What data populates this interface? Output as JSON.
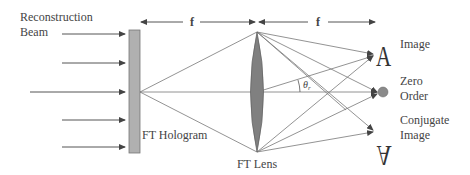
{
  "diagram": {
    "type": "optical-setup",
    "labels": {
      "reconstruction_beam_line1": "Reconstruction",
      "reconstruction_beam_line2": "Beam",
      "focal_length_1": "f",
      "focal_length_2": "f",
      "hologram": "FT Hologram",
      "lens": "FT Lens",
      "image": "Image",
      "zero_order_line1": "Zero",
      "zero_order_line2": "Order",
      "conjugate_line1": "Conjugate",
      "conjugate_line2": "Image",
      "angle_symbol": "θ",
      "angle_subscript": "r",
      "image_glyph": "A",
      "conjugate_glyph": "A"
    },
    "colors": {
      "line": "#555555",
      "hologram_fill": "#b0b0b0",
      "lens_fill": "#808080",
      "text": "#444444",
      "dot": "#8a8a8a"
    }
  }
}
